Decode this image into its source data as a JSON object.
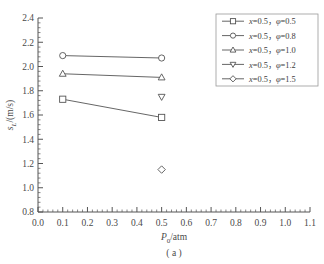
{
  "chart_data": {
    "type": "line",
    "title": "",
    "caption": "( a )",
    "xlabel": "P0/atm",
    "xlabel_main": "P",
    "xlabel_sub": "0",
    "xlabel_rest": "/atm",
    "ylabel": "sL/(m/s)",
    "ylabel_main": "s",
    "ylabel_sub": "L",
    "ylabel_rest": "/(m/s)",
    "xlim": [
      0.0,
      1.1
    ],
    "ylim": [
      0.8,
      2.4
    ],
    "xticks": [
      "0.0",
      "0.1",
      "0.2",
      "0.3",
      "0.4",
      "0.5",
      "0.6",
      "0.7",
      "0.8",
      "0.9",
      "1.0",
      "1.1"
    ],
    "xtick_values": [
      0.0,
      0.1,
      0.2,
      0.3,
      0.4,
      0.5,
      0.6,
      0.7,
      0.8,
      0.9,
      1.0,
      1.1
    ],
    "yticks": [
      "0.8",
      "1.0",
      "1.2",
      "1.4",
      "1.6",
      "1.8",
      "2.0",
      "2.2",
      "2.4"
    ],
    "ytick_values": [
      0.8,
      1.0,
      1.2,
      1.4,
      1.6,
      1.8,
      2.0,
      2.2,
      2.4
    ],
    "minor_ticks_per_interval": 5,
    "grid": false,
    "legend_position": "upper right",
    "line_color": "#555555",
    "marker_color": "#555555",
    "axis_color": "#555555",
    "series": [
      {
        "name": "x=0.5, φ=0.5",
        "label_x": "x",
        "label_xval": "=0.5，",
        "label_phi": "φ",
        "label_phival": "=0.5",
        "marker": "square",
        "connected": true,
        "x": [
          0.1,
          0.5
        ],
        "values": [
          1.73,
          1.58
        ]
      },
      {
        "name": "x=0.5, φ=0.8",
        "label_x": "x",
        "label_xval": "=0.5，",
        "label_phi": "φ",
        "label_phival": "=0.8",
        "marker": "circle",
        "connected": true,
        "x": [
          0.1,
          0.5
        ],
        "values": [
          2.09,
          2.07
        ]
      },
      {
        "name": "x=0.5, φ=1.0",
        "label_x": "x",
        "label_xval": "=0.5，",
        "label_phi": "φ",
        "label_phival": "=1.0",
        "marker": "triangle-up",
        "connected": true,
        "x": [
          0.1,
          0.5
        ],
        "values": [
          1.94,
          1.91
        ]
      },
      {
        "name": "x=0.5, φ=1.2",
        "label_x": "x",
        "label_xval": "=0.5，",
        "label_phi": "φ",
        "label_phival": "=1.2",
        "marker": "triangle-down",
        "connected": false,
        "x": [
          0.5
        ],
        "values": [
          1.75
        ]
      },
      {
        "name": "x=0.5, φ=1.5",
        "label_x": "x",
        "label_xval": "=0.5，",
        "label_phi": "φ",
        "label_phival": "=1.5",
        "marker": "diamond",
        "connected": false,
        "x": [
          0.5
        ],
        "values": [
          1.15
        ]
      }
    ]
  }
}
